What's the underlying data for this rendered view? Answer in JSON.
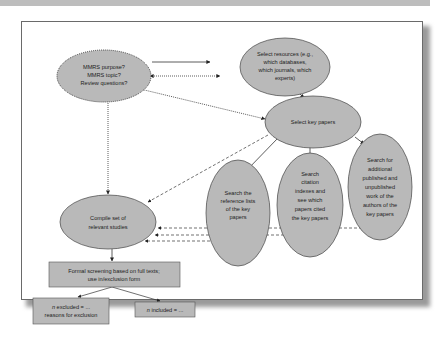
{
  "colors": {
    "node_fill": "#b9b9b9",
    "node_stroke": "#4a4a4a",
    "arrow": "#333333",
    "frame_border": "#6a6a6a",
    "top_bar": "#bdbdbd"
  },
  "nodes": {
    "mmrs_questions": {
      "shape": "ellipse",
      "border": "dotted",
      "lines": [
        "MMRS purpose?",
        "MMRS topic?",
        "Review questions?"
      ]
    },
    "select_resources": {
      "shape": "ellipse",
      "lines": [
        "Select resources (e.g.,",
        "which databases,",
        "which journals, which",
        "experts)"
      ]
    },
    "select_key_papers": {
      "shape": "ellipse",
      "lines": [
        "Select key papers"
      ]
    },
    "search_reference_lists": {
      "shape": "ellipse",
      "lines": [
        "Search the",
        "reference lists",
        "of the key",
        "papers"
      ]
    },
    "search_citation_indexes": {
      "shape": "ellipse",
      "lines": [
        "Search",
        "citation",
        "indexes and",
        "see which",
        "papers cited",
        "the key papers"
      ]
    },
    "search_additional_work": {
      "shape": "ellipse",
      "lines": [
        "Search for",
        "additional",
        "published and",
        "unpublished",
        "work of the",
        "authors of the",
        "key papers"
      ]
    },
    "compile_relevant_studies": {
      "shape": "ellipse",
      "lines": [
        "Compile set of",
        "relevant studies"
      ]
    },
    "formal_screening": {
      "shape": "rect",
      "lines": [
        "Formal screening based on full texts;",
        "use in/exclusion form"
      ]
    },
    "n_excluded": {
      "shape": "rect",
      "italic_prefix": "n",
      "lines": [
        " excluded = ...",
        "reasons for exclusion"
      ]
    },
    "n_included": {
      "shape": "rect",
      "italic_prefix": "n",
      "lines": [
        " included = ..."
      ]
    }
  },
  "edges": [
    {
      "from": "mmrs_questions",
      "to": "select_resources",
      "style": "solid"
    },
    {
      "from": "select_resources",
      "to": "mmrs_questions",
      "style": "dotted",
      "bidirectional": true
    },
    {
      "from": "select_key_papers",
      "to": "mmrs_questions",
      "style": "dotted",
      "bidirectional": true
    },
    {
      "from": "mmrs_questions",
      "to": "compile_relevant_studies",
      "style": "dotted",
      "bidirectional": true
    },
    {
      "from": "select_resources",
      "to": "select_key_papers",
      "style": "solid"
    },
    {
      "from": "select_key_papers",
      "to": "search_reference_lists",
      "style": "solid"
    },
    {
      "from": "select_key_papers",
      "to": "search_citation_indexes",
      "style": "solid"
    },
    {
      "from": "select_key_papers",
      "to": "search_additional_work",
      "style": "solid"
    },
    {
      "from": "select_key_papers",
      "to": "compile_relevant_studies",
      "style": "dashed"
    },
    {
      "from": "search_additional_work",
      "to": "compile_relevant_studies",
      "style": "dashed"
    },
    {
      "from": "search_citation_indexes",
      "to": "compile_relevant_studies",
      "style": "dashed"
    },
    {
      "from": "search_reference_lists",
      "to": "compile_relevant_studies",
      "style": "dashed"
    },
    {
      "from": "compile_relevant_studies",
      "to": "formal_screening",
      "style": "solid"
    },
    {
      "from": "formal_screening",
      "to": "n_excluded",
      "style": "solid"
    },
    {
      "from": "formal_screening",
      "to": "n_included",
      "style": "solid"
    }
  ]
}
